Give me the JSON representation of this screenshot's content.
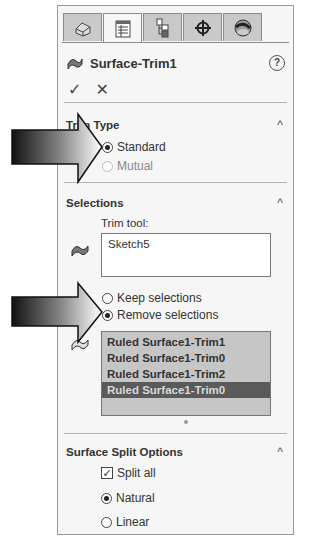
{
  "tabs": [
    {
      "name": "feature-manager",
      "icon": "feature-tree-icon",
      "active": false
    },
    {
      "name": "property-manager",
      "icon": "property-manager-icon",
      "active": true
    },
    {
      "name": "configuration-manager",
      "icon": "configuration-icon",
      "active": false
    },
    {
      "name": "dimxpert-manager",
      "icon": "crosshair-icon",
      "active": false
    },
    {
      "name": "display-manager",
      "icon": "appearance-sphere-icon",
      "active": false
    }
  ],
  "header": {
    "title": "Surface-Trim1",
    "help_glyph": "?",
    "ok_glyph": "✓",
    "cancel_glyph": "✕"
  },
  "trim_type": {
    "title": "Trim Type",
    "caret": "^",
    "options": [
      {
        "label": "Standard",
        "selected": true
      },
      {
        "label": "Mutual",
        "selected": false
      }
    ]
  },
  "selections": {
    "title": "Selections",
    "caret": "^",
    "trim_tool_label": "Trim tool:",
    "trim_tool_value": "Sketch5",
    "options": [
      {
        "label": "Keep selections",
        "selected": false
      },
      {
        "label": "Remove selections",
        "selected": true
      }
    ],
    "items": [
      {
        "label": "Ruled Surface1-Trim1",
        "selected": false
      },
      {
        "label": "Ruled Surface1-Trim0",
        "selected": false
      },
      {
        "label": "Ruled Surface1-Trim2",
        "selected": false
      },
      {
        "label": "Ruled Surface1-Trim0",
        "selected": true
      }
    ]
  },
  "split_options": {
    "title": "Surface Split Options",
    "caret": "^",
    "split_all_label": "Split all",
    "split_all_checked": true,
    "check_glyph": "✓",
    "options": [
      {
        "label": "Natural",
        "selected": true
      },
      {
        "label": "Linear",
        "selected": false
      }
    ]
  }
}
